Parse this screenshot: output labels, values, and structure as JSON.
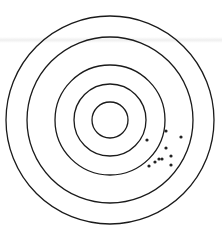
{
  "figure": {
    "type": "shooting-target",
    "width": 222,
    "height": 236,
    "center": {
      "x": 110,
      "y": 120
    },
    "ring_color": "#1a1a1a",
    "ring_stroke_width": 1.3,
    "rings": [
      {
        "r": 104
      },
      {
        "r": 83
      },
      {
        "r": 55
      },
      {
        "r": 36
      },
      {
        "r": 18
      }
    ],
    "shot_color": "#222222",
    "shot_radius": 1.6,
    "shots": [
      {
        "x": 166,
        "y": 131
      },
      {
        "x": 181,
        "y": 137
      },
      {
        "x": 147,
        "y": 140
      },
      {
        "x": 166,
        "y": 148
      },
      {
        "x": 171,
        "y": 156
      },
      {
        "x": 159,
        "y": 159
      },
      {
        "x": 162,
        "y": 159
      },
      {
        "x": 155,
        "y": 162
      },
      {
        "x": 149,
        "y": 166
      },
      {
        "x": 171,
        "y": 165
      }
    ]
  }
}
